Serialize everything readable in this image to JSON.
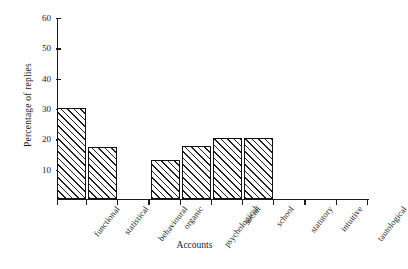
{
  "chart_data": {
    "type": "bar",
    "title": "",
    "xlabel": "Accounts",
    "ylabel": "Percentage of replies",
    "categories": [
      "functional",
      "statistical",
      "behavioural",
      "organic",
      "psychological",
      "social",
      "school",
      "statutory",
      "intuitive",
      "tautological"
    ],
    "values": [
      30,
      17,
      0,
      13,
      17.5,
      20,
      20,
      0,
      0,
      0
    ],
    "ylim": [
      0,
      60
    ],
    "yticks": [
      10,
      20,
      30,
      40,
      50,
      60
    ],
    "ytick_labels": [
      "10",
      "20",
      "30",
      "40",
      "50",
      "60"
    ],
    "grid": false,
    "legend": null,
    "bar_style": {
      "fill": "diagonal-hatch",
      "edge_color": "#111111",
      "face_color": "#fdfdfd"
    }
  }
}
